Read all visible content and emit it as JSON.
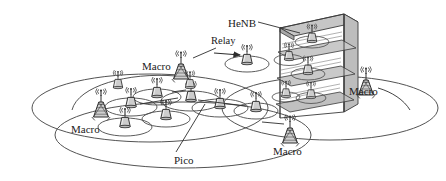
{
  "figure": {
    "type": "network-architecture-diagram",
    "topic": "Heterogeneous network (HetNet) deployment with macro, pico, relay and femto (HeNB) cells",
    "background_color": "#ffffff",
    "line_color": "#3a3a3a",
    "fill_gray": "#b8b8b8",
    "fill_gray_light": "#d2d2d2",
    "fill_gray_dark": "#9a9a9a",
    "width": 446,
    "height": 181
  },
  "labels": [
    {
      "id": "henb",
      "text": "HeNB",
      "x": 228,
      "y": 18,
      "kind": "callout"
    },
    {
      "id": "relay",
      "text": "Relay",
      "x": 211,
      "y": 41,
      "kind": "callout"
    },
    {
      "id": "macro-1",
      "text": "Macro",
      "x": 142,
      "y": 66,
      "kind": "node"
    },
    {
      "id": "macro-2",
      "text": "Macro",
      "x": 349,
      "y": 88,
      "kind": "node"
    },
    {
      "id": "macro-3",
      "text": "Macro",
      "x": 71,
      "y": 128,
      "kind": "node"
    },
    {
      "id": "macro-4",
      "text": "Macro",
      "x": 273,
      "y": 148,
      "kind": "node"
    },
    {
      "id": "pico",
      "text": "Pico",
      "x": 174,
      "y": 160,
      "kind": "callout"
    }
  ],
  "macro_towers": [
    {
      "id": "macro-tower-1",
      "x": 181,
      "y": 72,
      "scale": 1.0
    },
    {
      "id": "macro-tower-2",
      "x": 366,
      "y": 88,
      "scale": 1.0
    },
    {
      "id": "macro-tower-3",
      "x": 101,
      "y": 110,
      "scale": 1.0
    },
    {
      "id": "macro-tower-4",
      "x": 290,
      "y": 136,
      "scale": 1.0
    }
  ],
  "macro_coverage_ellipses": [
    {
      "id": "macro-cell-1",
      "cx": 150,
      "cy": 108,
      "rx": 118,
      "ry": 34
    },
    {
      "id": "macro-cell-2",
      "cx": 330,
      "cy": 108,
      "rx": 108,
      "ry": 32
    },
    {
      "id": "macro-cell-3",
      "cx": 183,
      "cy": 135,
      "rx": 128,
      "ry": 33
    }
  ],
  "relay_node": {
    "id": "relay-node",
    "x": 247,
    "y": 62,
    "cell_rx": 22,
    "cell_ry": 8
  },
  "pico_nodes": [
    {
      "id": "pico-1",
      "x": 131,
      "y": 106,
      "cell_rx": 26,
      "cell_ry": 9
    },
    {
      "id": "pico-2",
      "x": 156,
      "y": 96,
      "cell_rx": 24,
      "cell_ry": 8
    },
    {
      "id": "pico-3",
      "x": 190,
      "y": 100,
      "cell_rx": 30,
      "cell_ry": 10
    },
    {
      "id": "pico-4",
      "x": 125,
      "y": 126,
      "cell_rx": 27,
      "cell_ry": 9
    },
    {
      "id": "pico-5",
      "x": 219,
      "y": 107,
      "cell_rx": 28,
      "cell_ry": 9
    },
    {
      "id": "pico-6",
      "x": 256,
      "y": 110,
      "cell_rx": 22,
      "cell_ry": 8
    },
    {
      "id": "pico-7",
      "x": 165,
      "y": 118,
      "cell_rx": 24,
      "cell_ry": 8
    }
  ],
  "henb_building": {
    "id": "henb-building",
    "x": 268,
    "y": 14,
    "width": 72,
    "height": 104,
    "floors": 3,
    "femto_nodes": [
      {
        "id": "femto-1",
        "x": 312,
        "y": 40
      },
      {
        "id": "femto-2",
        "x": 288,
        "y": 58
      },
      {
        "id": "femto-3",
        "x": 308,
        "y": 72
      },
      {
        "id": "femto-4",
        "x": 285,
        "y": 94
      },
      {
        "id": "femto-5",
        "x": 310,
        "y": 96
      }
    ]
  },
  "leader_lines": [
    {
      "id": "leader-henb",
      "from": [
        259,
        22
      ],
      "to": [
        300,
        34
      ]
    },
    {
      "id": "leader-pico",
      "from": [
        176,
        152
      ],
      "to": [
        205,
        104
      ]
    },
    {
      "id": "leader-relay-arrow",
      "from": [
        216,
        52
      ],
      "to": [
        241,
        54
      ]
    }
  ],
  "icons": {
    "macro_tower": "macro-tower-icon",
    "pico_node": "pico-node-icon",
    "relay_node": "relay-node-icon",
    "femto_node": "femto-node-icon",
    "antenna_signal": "antenna-signal-icon",
    "building": "building-icon",
    "arrow": "arrow-icon"
  }
}
